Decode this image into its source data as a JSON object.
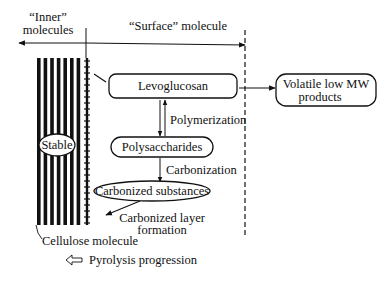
{
  "diagram": {
    "regions": {
      "inner": {
        "line1": "“Inner”",
        "line2": "molecules"
      },
      "surface": "“Surface” molecule"
    },
    "nodes": {
      "stable": "Stable",
      "levoglucosan": "Levoglucosan",
      "volatile": {
        "line1": "Volatile low MW",
        "line2": "products"
      },
      "polysaccharides": "Polysaccharides",
      "carbonized_substances": "Carbonized substances"
    },
    "edge_labels": {
      "polymerization": "Polymerization",
      "carbonization": "Carbonization",
      "carbonized_layer": {
        "line1": "Carbonized layer",
        "line2": "formation"
      }
    },
    "captions": {
      "cellulose": "Cellulose molecule",
      "legend_arrow": "Pyrolysis progression"
    },
    "stripe_count": 7
  }
}
